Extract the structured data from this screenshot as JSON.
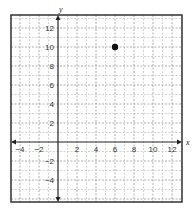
{
  "chart_data": {
    "type": "scatter",
    "title": "",
    "xlabel": "x",
    "ylabel": "y",
    "xlim": [
      -5,
      13
    ],
    "ylim": [
      -6.3,
      13.4
    ],
    "grid": true,
    "grid_step": 1,
    "x_ticks": [
      -4,
      -2,
      2,
      4,
      6,
      8,
      10,
      12
    ],
    "y_ticks": [
      -4,
      -2,
      2,
      4,
      6,
      8,
      10,
      12
    ],
    "x_tick_labels": [
      "−4",
      "−2",
      "2",
      "4",
      "6",
      "8",
      "10",
      "12"
    ],
    "y_tick_labels": [
      "−4",
      "−2",
      "2",
      "4",
      "6",
      "8",
      "10",
      "12"
    ],
    "points": [
      {
        "x": 6,
        "y": 10
      }
    ],
    "legend": null
  },
  "layout": {
    "frame": {
      "left": 11,
      "top": 15,
      "right": 182,
      "bottom": 202
    },
    "origin": {
      "x": 58,
      "y": 142
    },
    "unit_px": 9.5
  },
  "colors": {
    "frame": "#333333",
    "axis": "#222222",
    "grid_minor": "#c8c8c8",
    "grid_major": "#9a9a9a",
    "point": "#111111"
  }
}
